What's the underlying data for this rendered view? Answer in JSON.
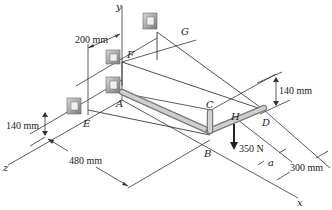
{
  "figure": {
    "type": "3D statics diagram",
    "axes": {
      "x": "x",
      "y": "y",
      "z": "z"
    },
    "points": {
      "A": "A",
      "B": "B",
      "C": "C",
      "D": "D",
      "E": "E",
      "F": "F",
      "G": "G",
      "H": "H"
    },
    "dimensions": {
      "top_offset": "200 mm",
      "right_height": "140 mm",
      "left_height": "140 mm",
      "z_length": "480 mm",
      "x_length": "300 mm",
      "load_offset": "a"
    },
    "load": {
      "label": "350 N",
      "point": "H",
      "direction": "down"
    },
    "colors": {
      "line": "#333333",
      "bar": "#b9b9b9",
      "bracket": "#9a9a9a"
    }
  }
}
